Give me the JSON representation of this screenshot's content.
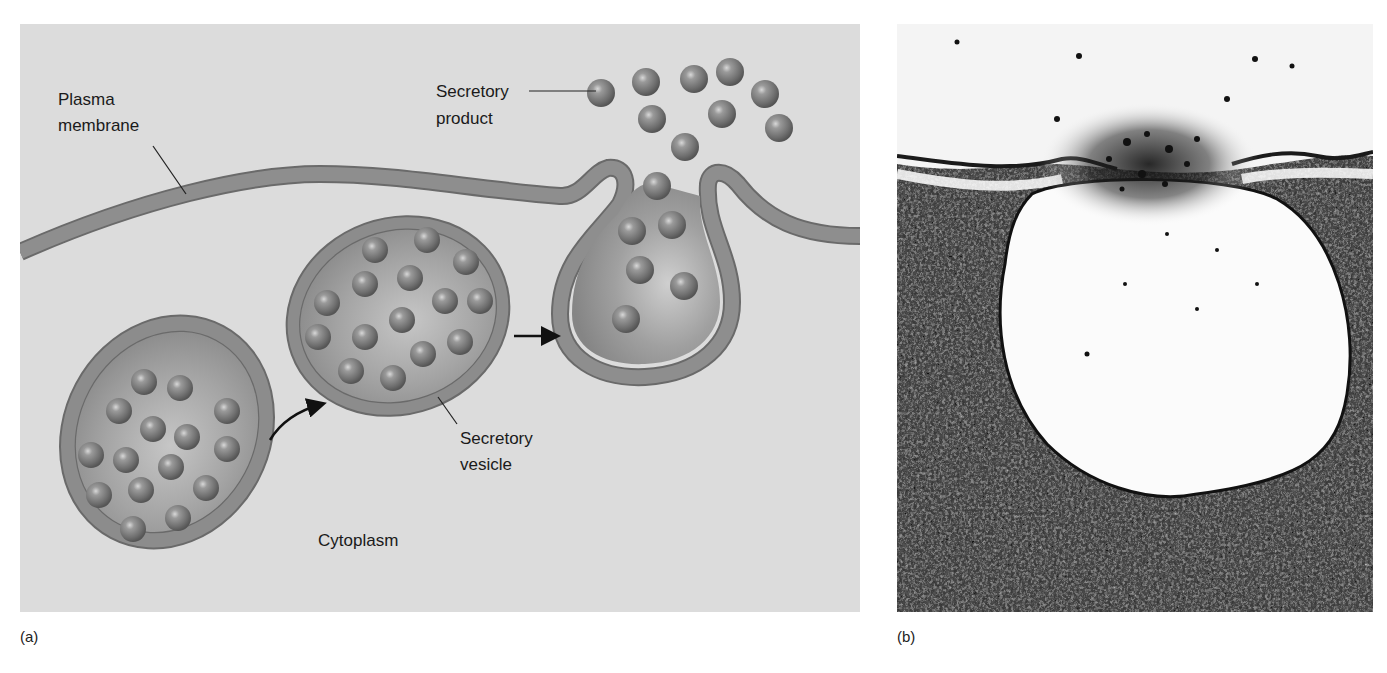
{
  "figure": {
    "panels": [
      {
        "id": "a",
        "letter": "(a)",
        "type": "illustration",
        "labels": {
          "plasma_membrane": "Plasma membrane",
          "plasma_membrane_line1": "Plasma",
          "plasma_membrane_line2": "membrane",
          "secretory_product_line1": "Secretory",
          "secretory_product_line2": "product",
          "secretory_vesicle_line1": "Secretory",
          "secretory_vesicle_line2": "vesicle",
          "cytoplasm": "Cytoplasm"
        },
        "colors": {
          "background": "#dcdcdc",
          "membrane": "#8a8a8a",
          "membrane_edge": "#6a6a6a",
          "vesicle_interior": "#9c9c9c",
          "granule": "#7d7d7d",
          "arrow": "#111111"
        }
      },
      {
        "id": "b",
        "letter": "(b)",
        "type": "electron-micrograph"
      }
    ]
  }
}
